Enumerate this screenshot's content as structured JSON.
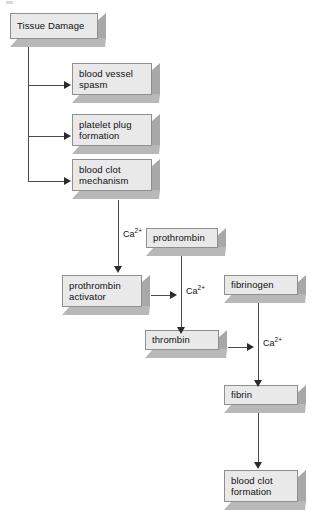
{
  "diagram": {
    "colors": {
      "box_face": "#e9e9e9",
      "box_side": "#a8a8a8",
      "box_bottom": "#b8b8b8",
      "box_border": "#8f8f8f",
      "connector": "#4a4a4a",
      "arrowhead": "#2b2b2b",
      "background": "#ffffff",
      "text": "#101010"
    },
    "nodes": [
      {
        "id": "tissue-damage",
        "label": "Tissue Damage"
      },
      {
        "id": "blood-vessel-spasm",
        "label": "blood vessel\nspasm"
      },
      {
        "id": "platelet-plug",
        "label": "platelet plug\nformation"
      },
      {
        "id": "blood-clot-mechanism",
        "label": "blood clot\nmechanism"
      },
      {
        "id": "prothrombin",
        "label": "prothrombin"
      },
      {
        "id": "prothrombin-activator",
        "label": "prothrombin\nactivator"
      },
      {
        "id": "fibrinogen",
        "label": "fibrinogen"
      },
      {
        "id": "thrombin",
        "label": "thrombin"
      },
      {
        "id": "fibrin",
        "label": "fibrin"
      },
      {
        "id": "blood-clot-formation",
        "label": "blood clot\nformation"
      }
    ],
    "cofactor_labels": [
      {
        "id": "ca-1",
        "element": "Ca",
        "charge": "2+"
      },
      {
        "id": "ca-2",
        "element": "Ca",
        "charge": "2+"
      },
      {
        "id": "ca-3",
        "element": "Ca",
        "charge": "2+"
      }
    ]
  }
}
